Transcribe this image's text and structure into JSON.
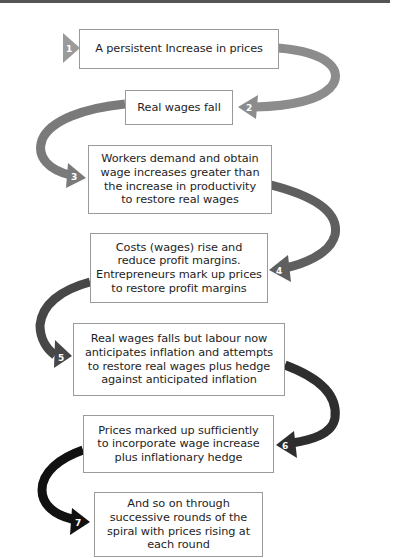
{
  "diagram": {
    "steps": [
      {
        "number": "1",
        "text": "A persistent Increase in prices",
        "arrow_color": "#9a9a9a"
      },
      {
        "number": "2",
        "text": "Real wages fall",
        "arrow_color": "#8c8c8c"
      },
      {
        "number": "3",
        "text": "Workers demand and obtain\nwage increases greater than\nthe increase in productivity\nto restore real wages",
        "arrow_color": "#7a7a7a"
      },
      {
        "number": "4",
        "text": "Costs (wages) rise and\nreduce profit margins.\nEntrepreneurs mark up prices\nto restore profit margins",
        "arrow_color": "#5f5f5f"
      },
      {
        "number": "5",
        "text": "Real wages falls but labour now\nanticipates inflation and attempts\nto restore real wages plus hedge\nagainst anticipated inflation",
        "arrow_color": "#474747"
      },
      {
        "number": "6",
        "text": "Prices marked up sufficiently\nto incorporate wage increase\nplus inflationary hedge",
        "arrow_color": "#2e2e2e"
      },
      {
        "number": "7",
        "text": "And so on through\nsuccessive rounds of the\nspiral with prices rising at\neach round",
        "arrow_color": "#111111"
      }
    ]
  }
}
